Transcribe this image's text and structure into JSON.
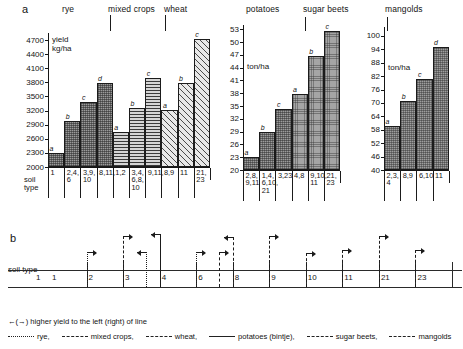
{
  "figure": {
    "panel_a_letter": "a",
    "panel_b_letter": "b"
  },
  "chart_data": [
    {
      "type": "bar",
      "id": "cereals",
      "title": "",
      "ylabel": "yield kg/ha",
      "unit_line1": "yield",
      "unit_line2": "kg/ha",
      "ylim": [
        2000,
        4850
      ],
      "yticks": [
        2000,
        2300,
        2600,
        2900,
        3200,
        3500,
        3800,
        4100,
        4400,
        4700
      ],
      "grid": false,
      "groups": [
        {
          "name": "rye",
          "label": "rye",
          "categories": [
            "1",
            "2,4,\n6",
            "3,9,\n10",
            "8,11,"
          ],
          "values": [
            2300,
            2980,
            3390,
            3790
          ],
          "sig": [
            "a",
            "b",
            "c",
            "d"
          ]
        },
        {
          "name": "mixed crops",
          "label": "mixed crops",
          "categories": [
            "1,2",
            "3,4,\n6,8,\n10",
            "9,11,"
          ],
          "values": [
            2750,
            3260,
            3900
          ],
          "sig": [
            "a",
            "b",
            "c"
          ]
        },
        {
          "name": "wheat",
          "label": "wheat",
          "categories": [
            "8,9",
            "11",
            "21,\n23"
          ],
          "values": [
            3210,
            3790,
            4720
          ],
          "sig": [
            "a",
            "b",
            "c"
          ]
        }
      ]
    },
    {
      "type": "bar",
      "id": "roots1",
      "title": "",
      "ylabel": "ton/ha",
      "unit_line1": "ton/ha",
      "unit_line2": "",
      "ylim": [
        20,
        54
      ],
      "yticks": [
        20,
        23,
        26,
        29,
        32,
        35,
        38,
        41,
        44,
        47,
        50,
        53
      ],
      "grid": false,
      "groups": [
        {
          "name": "potatoes",
          "label": "potatoes",
          "categories": [
            "2,8,\n9,11",
            "1,4,\n6,10,\n21",
            "3,23"
          ],
          "values": [
            23.0,
            28.9,
            34.4
          ],
          "sig": [
            "a",
            "b",
            "c"
          ]
        },
        {
          "name": "sugar beets",
          "label": "sugar beets",
          "categories": [
            "4,8",
            "9,10,\n11",
            "21,\n23"
          ],
          "values": [
            37.9,
            46.8,
            52.7
          ],
          "sig": [
            "a",
            "b",
            "c"
          ]
        }
      ]
    },
    {
      "type": "bar",
      "id": "roots2",
      "title": "",
      "ylabel": "ton/ha",
      "unit_line1": "ton/ha",
      "unit_line2": "",
      "ylim": [
        40,
        104
      ],
      "yticks": [
        40,
        46,
        52,
        58,
        64,
        70,
        76,
        82,
        88,
        94,
        100
      ],
      "grid": false,
      "groups": [
        {
          "name": "mangolds",
          "label": "mangolds",
          "categories": [
            "2,3,\n4",
            "8,9",
            "6,10",
            "11"
          ],
          "values": [
            59.5,
            70.8,
            80.9,
            95.0
          ],
          "sig": [
            "a",
            "b",
            "c",
            "d"
          ]
        }
      ]
    }
  ],
  "panel_a": {
    "axis_captions": {
      "soil_type": "soil\ntype",
      "soil_type_l1": "soil",
      "soil_type_l2": "type"
    },
    "group_titles": [
      "rye",
      "mixed crops",
      "wheat",
      "potatoes",
      "sugar beets",
      "mangolds"
    ]
  },
  "panel_b": {
    "axis_label": "soil type",
    "soil_types": [
      "1",
      "2",
      "3",
      "4",
      "6",
      "8",
      "9",
      "10",
      "11",
      "21",
      "23"
    ],
    "markers": [
      {
        "at": "2",
        "dir": "right",
        "crop": "rye",
        "style": "dotted"
      },
      {
        "at": "3",
        "dir": "right",
        "crop": "mixed crops",
        "style": "dashdot"
      },
      {
        "at": "3b",
        "dir": "left",
        "crop": "rye",
        "style": "dotted"
      },
      {
        "at": "4",
        "dir": "left",
        "crop": "potatoes",
        "style": "solid"
      },
      {
        "at": "6",
        "dir": "right",
        "crop": "rye",
        "style": "dotted"
      },
      {
        "at": "6b",
        "dir": "right",
        "crop": "wheat",
        "style": "dashed"
      },
      {
        "at": "8",
        "dir": "left",
        "crop": "sugar beets",
        "style": "dashed"
      },
      {
        "at": "9",
        "dir": "right",
        "crop": "mixed crops",
        "style": "dashdot"
      },
      {
        "at": "10",
        "dir": "right",
        "crop": "mangolds",
        "style": "dashdot"
      },
      {
        "at": "11",
        "dir": "right",
        "crop": "sugar beets",
        "style": "dashed"
      },
      {
        "at": "21",
        "dir": "right",
        "crop": "mixed crops",
        "style": "dashdot"
      },
      {
        "at": "23",
        "dir": "right",
        "crop": "wheat",
        "style": "dashed"
      }
    ]
  },
  "legend": {
    "arrow_note": "(→) higher  yield to the left (right) of line",
    "arrow_left_glyph": "←",
    "arrow_right_glyph": "→",
    "items": [
      {
        "label": "rye,",
        "style": "dotted"
      },
      {
        "label": "mixed crops,",
        "style": "dashdot"
      },
      {
        "label": "wheat,",
        "style": "dashed"
      },
      {
        "label": "potatoes (bintje),",
        "style": "solid"
      },
      {
        "label": "sugar beets,",
        "style": "dashed"
      },
      {
        "label": "mangolds",
        "style": "dashdot"
      }
    ]
  }
}
